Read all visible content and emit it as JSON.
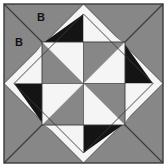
{
  "figure": {
    "name": "quilt-block-diagram",
    "width": 167,
    "height": 167
  },
  "colors": {
    "gray": "#878787",
    "black": "#141414",
    "white": "#f5f5f5",
    "outline": "#3a3a3a",
    "background": "#ffffff",
    "label_text": "#121212"
  },
  "labels": [
    {
      "text": "B",
      "x": 41,
      "y": 21,
      "region": "upper-corner-triangle"
    },
    {
      "text": "B",
      "x": 19,
      "y": 46,
      "region": "left-corner-triangle"
    }
  ],
  "geometry": {
    "outer_square": {
      "x": 4,
      "y": 4,
      "size": 159
    },
    "inner_diamond_points": "83.5,4 163,83.5 83.5,163 4,83.5",
    "center_square": {
      "x": 42,
      "y": 42,
      "size": 83
    },
    "corner_triangles": [
      {
        "name": "top-left-upper",
        "points": "4,4 163,4 83.5,4",
        "fill": "gray"
      },
      {
        "name": "corner-split-line",
        "note": "thin diagonal divides each outer corner triangle"
      }
    ]
  },
  "pattern": {
    "description": "Square-in-a-square quilt block: gray outer corner triangles with diagonal split lines, white sashing diamond, black-and-white flying-geese edge units, and a gray/white pinwheel center.",
    "center_pinwheel": [
      {
        "quadrant": "top-left",
        "gray_corner": "bottom-left",
        "white_corner": "top-right"
      },
      {
        "quadrant": "top-right",
        "gray_corner": "top-left",
        "white_corner": "bottom-right"
      },
      {
        "quadrant": "bottom-left",
        "gray_corner": "bottom-right",
        "white_corner": "top-left"
      },
      {
        "quadrant": "bottom-right",
        "gray_corner": "top-right",
        "white_corner": "bottom-left"
      }
    ],
    "edge_units": [
      {
        "side": "top",
        "left_half": "black",
        "right_half": "white"
      },
      {
        "side": "right",
        "top_half": "black",
        "bottom_half": "white"
      },
      {
        "side": "bottom",
        "left_half": "white",
        "right_half": "black"
      },
      {
        "side": "left",
        "top_half": "white",
        "bottom_half": "black"
      }
    ],
    "corner_regions": [
      {
        "corner": "top-left",
        "fill": "gray",
        "label": "B"
      },
      {
        "corner": "top-right",
        "fill": "gray",
        "label": ""
      },
      {
        "corner": "bottom-left",
        "fill": "gray",
        "label": ""
      },
      {
        "corner": "bottom-right",
        "fill": "gray",
        "label": ""
      }
    ]
  }
}
